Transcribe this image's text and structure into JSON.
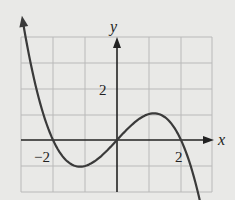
{
  "chart_data": {
    "type": "line",
    "title": "",
    "xlabel": "x",
    "ylabel": "y",
    "function": "y = -(1/3)x(x-2)(x+2)",
    "x_ticks_labeled": [
      {
        "value": -2,
        "label": "−2"
      },
      {
        "value": 2,
        "label": "2"
      }
    ],
    "y_ticks_labeled": [
      {
        "value": 2,
        "label": "2"
      }
    ],
    "xlim": [
      -3,
      3
    ],
    "ylim": [
      -2,
      4
    ],
    "grid": true,
    "series": [
      {
        "name": "curve",
        "x": [
          -3,
          -2.5,
          -2,
          -1.5,
          -1,
          -0.5,
          0,
          0.5,
          1,
          1.5,
          2,
          2.5,
          3
        ],
        "values": [
          5,
          2.04,
          0,
          -0.875,
          -1,
          -0.625,
          0,
          0.625,
          1,
          0.875,
          0,
          -2.04,
          -5
        ]
      }
    ],
    "labels": {
      "x_axis": "x",
      "y_axis": "y",
      "x_neg2": "−2",
      "x_pos2": "2",
      "y_pos2": "2"
    }
  }
}
